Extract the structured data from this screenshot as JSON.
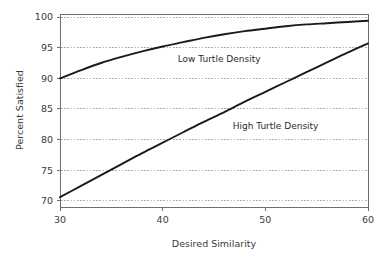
{
  "chart_data": {
    "type": "line",
    "title": "",
    "xlabel": "Desired Similarity",
    "ylabel": "Percent Satisfied",
    "xlim": [
      30,
      60
    ],
    "ylim": [
      69,
      100.5
    ],
    "xticks": [
      30,
      40,
      50,
      60
    ],
    "yticks": [
      70,
      75,
      80,
      85,
      90,
      95,
      100
    ],
    "xtick_labels": [
      "30",
      "40",
      "50",
      "60"
    ],
    "ytick_labels": [
      "70",
      "75",
      "80",
      "85",
      "90",
      "95",
      "100"
    ],
    "grid": "horizontal-dotted",
    "legend": "inline-annotations",
    "series": [
      {
        "name": "Low Turtle Density",
        "label_x": 45.5,
        "label_y": 92.6,
        "x": [
          30,
          32,
          34,
          36,
          38,
          40,
          42,
          44,
          46,
          48,
          50,
          52,
          54,
          56,
          58,
          60
        ],
        "values": [
          90.0,
          91.3,
          92.5,
          93.5,
          94.4,
          95.2,
          95.9,
          96.6,
          97.2,
          97.7,
          98.1,
          98.5,
          98.8,
          99.0,
          99.2,
          99.4
        ]
      },
      {
        "name": "High Turtle Density",
        "label_x": 51.0,
        "label_y": 81.7,
        "x": [
          30,
          32,
          34,
          36,
          38,
          40,
          42,
          44,
          46,
          48,
          50,
          52,
          54,
          56,
          58,
          60
        ],
        "values": [
          70.6,
          72.4,
          74.2,
          76.0,
          77.8,
          79.5,
          81.2,
          82.9,
          84.5,
          86.2,
          87.8,
          89.4,
          91.0,
          92.6,
          94.2,
          95.7
        ]
      }
    ]
  },
  "axes": {
    "y_title": "Percent Satisfied",
    "x_title": "Desired Similarity"
  },
  "annotations": {
    "low_density_label": "Low Turtle Density",
    "high_density_label": "High Turtle Density"
  },
  "colors": {
    "curve": "#1a1a1a",
    "grid": "#8c8c8c",
    "axis": "#6e6e6e",
    "text": "#2b2b2b",
    "background": "#ffffff"
  }
}
